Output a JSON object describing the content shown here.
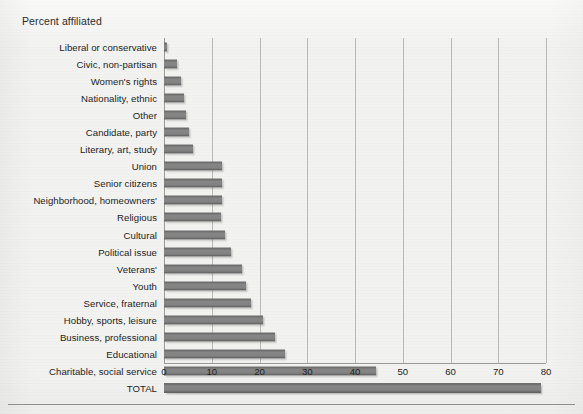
{
  "chart_title": "Percent affiliated",
  "axis": {
    "ticks": [
      "0",
      "10",
      "20",
      "30",
      "40",
      "50",
      "60",
      "70",
      "80"
    ]
  },
  "chart_data": {
    "type": "bar",
    "orientation": "horizontal",
    "title": "Percent affiliated",
    "xlabel": "",
    "ylabel": "",
    "xlim": [
      0,
      80
    ],
    "grid": true,
    "legend": false,
    "categories": [
      "Liberal or conservative",
      "Civic, non-partisan",
      "Women's rights",
      "Nationality, ethnic",
      "Other",
      "Candidate, party",
      "Literary, art, study",
      "Union",
      "Senior citizens",
      "Neighborhood, homeowners'",
      "Religious",
      "Cultural",
      "Political issue",
      "Veterans'",
      "Youth",
      "Service, fraternal",
      "Hobby, sports, leisure",
      "Business, professional",
      "Educational",
      "Charitable, social service",
      "TOTAL"
    ],
    "values": [
      0.7,
      2.8,
      3.6,
      4.2,
      4.6,
      5.3,
      6.1,
      12.1,
      12.1,
      12.1,
      11.9,
      12.8,
      14.0,
      16.4,
      17.1,
      18.2,
      20.8,
      23.2,
      25.3,
      44.4,
      79.0
    ],
    "tick_values": [
      0,
      10,
      20,
      30,
      40,
      50,
      60,
      70,
      80
    ],
    "bar_color": "#808080",
    "grid_color": "#b9b9b7",
    "background_color": "#f2f2f1"
  }
}
